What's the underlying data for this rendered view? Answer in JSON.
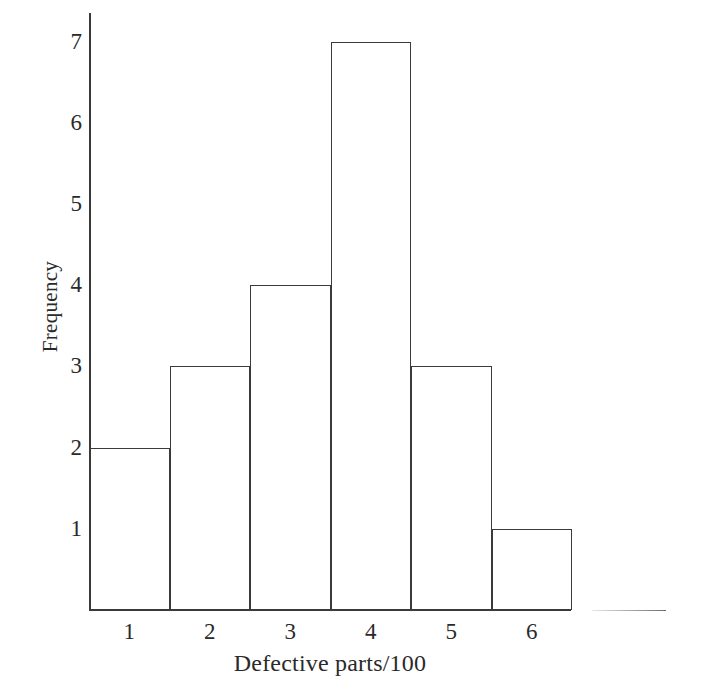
{
  "chart_data": {
    "type": "bar",
    "title": "",
    "xlabel": "Defective parts/100",
    "ylabel": "Frequency",
    "categories": [
      "1",
      "2",
      "3",
      "4",
      "5",
      "6"
    ],
    "values": [
      2,
      3,
      4,
      7,
      3,
      1
    ],
    "xticks": [
      "1",
      "2",
      "3",
      "4",
      "5",
      "6"
    ],
    "yticks": [
      "1",
      "2",
      "3",
      "4",
      "5",
      "6",
      "7"
    ],
    "ylim": [
      0,
      7.35
    ],
    "grid": false,
    "legend": false,
    "bar_style": "outlined-unfilled",
    "colors": {
      "axis": "#3a3a3a",
      "bar_outline": "#3a3a3a",
      "bar_fill": "transparent",
      "text": "#2a2a2a",
      "background": "#ffffff"
    }
  }
}
